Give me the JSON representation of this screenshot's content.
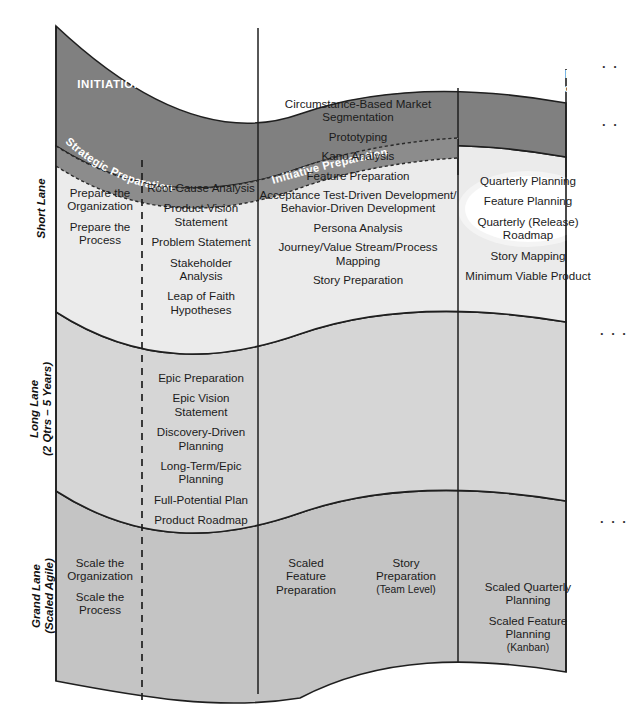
{
  "diagram": {
    "colors": {
      "band_fill": "#808080",
      "short_lane_fill": "#ebebeb",
      "long_lane_fill": "#d6d6d6",
      "grand_lane_fill": "#c4c4c4",
      "prep_band_fill": "#8c8c8c",
      "stroke": "#1f1f1f",
      "highlight_ellipse": "#ffffff",
      "band_text": "#ffffff",
      "body_text": "#1b1b1b"
    }
  },
  "phases": [
    {
      "id": "initiation-and-planning",
      "label": "INITIATION AND PLANNING",
      "sub": ""
    },
    {
      "id": "seeding-the-backlog",
      "label": "SEEDING THE BACKLOG",
      "sub": ""
    },
    {
      "id": "quarterly-inception",
      "label": "QUARTERLY INCEPTION",
      "sub": "Feature Inception"
    }
  ],
  "prep_bands": [
    {
      "id": "strategic-preparation",
      "label": "Strategic  Preparation"
    },
    {
      "id": "initiative-preparation",
      "label": "Initiative Preparation"
    }
  ],
  "lanes": [
    {
      "id": "short-lane",
      "label": "Short Lane",
      "label_line2": ""
    },
    {
      "id": "long-lane",
      "label": "Long Lane",
      "label_line2": "(2 Qtrs – 5 Years)"
    },
    {
      "id": "grand-lane",
      "label": "Grand Lane",
      "label_line2": "(Scaled Agile)"
    }
  ],
  "cells": {
    "short_strategic": {
      "items": [
        {
          "text": "Prepare the\nOrganization"
        },
        {
          "text": "Prepare the\nProcess"
        }
      ]
    },
    "short_initiative": {
      "items": [
        {
          "text": "Root-Cause Analysis"
        },
        {
          "text": "Product Vision\nStatement"
        },
        {
          "text": "Problem Statement"
        },
        {
          "text": "Stakeholder\nAnalysis"
        },
        {
          "text": "Leap of Faith\nHypotheses"
        }
      ]
    },
    "short_seeding": {
      "items": [
        {
          "text": "Circumstance-Based Market\nSegmentation"
        },
        {
          "text": "Prototyping"
        },
        {
          "text": "Kano Analysis"
        },
        {
          "text": "Feature Preparation"
        },
        {
          "text": "Acceptance Test-Driven Development/\nBehavior-Driven Development"
        },
        {
          "text": "Persona Analysis"
        },
        {
          "text": "Journey/Value Stream/Process\nMapping"
        },
        {
          "text": "Story Preparation"
        }
      ]
    },
    "short_quarterly": {
      "items": [
        {
          "text": "Quarterly Planning"
        },
        {
          "text": "Feature Planning"
        },
        {
          "text": "Quarterly (Release)\nRoadmap"
        },
        {
          "text": "Story Mapping"
        },
        {
          "text": "Minimum Viable Product"
        }
      ]
    },
    "long_initiative": {
      "items": [
        {
          "text": "Epic Preparation"
        },
        {
          "text": "Epic Vision\nStatement"
        },
        {
          "text": "Discovery-Driven\nPlanning"
        },
        {
          "text": "Long-Term/Epic\nPlanning"
        },
        {
          "text": "Full-Potential Plan"
        },
        {
          "text": "Product Roadmap"
        }
      ]
    },
    "grand_strategic": {
      "items": [
        {
          "text": "Scale the\nOrganization"
        },
        {
          "text": "Scale the\nProcess"
        }
      ]
    },
    "grand_seeding_left": {
      "items": [
        {
          "text": "Scaled\nFeature\nPreparation"
        }
      ]
    },
    "grand_seeding_right": {
      "items": [
        {
          "text": "Story\nPreparation",
          "sub": "(Team Level)"
        }
      ]
    },
    "grand_quarterly": {
      "items": [
        {
          "text": "Scaled Quarterly\nPlanning"
        },
        {
          "text": "Scaled Feature\nPlanning",
          "sub": "(Kanban)"
        }
      ]
    }
  },
  "edge_marks": [
    {
      "id": "ellipsis-top",
      "text": "· ·"
    },
    {
      "id": "ellipsis-upper",
      "text": "· ·"
    },
    {
      "id": "ellipsis-middle",
      "text": "· · ·"
    },
    {
      "id": "ellipsis-lower",
      "text": "· · ·"
    }
  ]
}
